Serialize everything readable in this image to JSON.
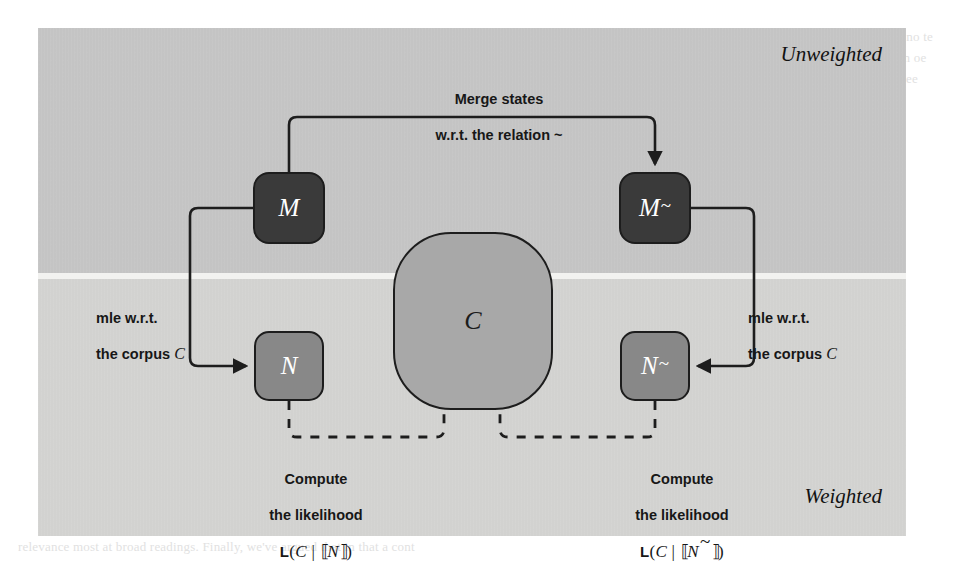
{
  "figure": {
    "regions": [
      {
        "name": "unweighted",
        "label": "Unweighted"
      },
      {
        "name": "weighted",
        "label": "Weighted"
      }
    ],
    "nodes": [
      {
        "id": "M",
        "label": "M",
        "tilde": false,
        "fill": "#3a3a3a",
        "text_color": "#ffffff",
        "shape": "rounded-square"
      },
      {
        "id": "Mt",
        "label": "M",
        "tilde": true,
        "fill": "#3a3a3a",
        "text_color": "#ffffff",
        "shape": "rounded-square"
      },
      {
        "id": "N",
        "label": "N",
        "tilde": false,
        "fill": "#888888",
        "text_color": "#ffffff",
        "shape": "rounded-square"
      },
      {
        "id": "Nt",
        "label": "N",
        "tilde": true,
        "fill": "#888888",
        "text_color": "#ffffff",
        "shape": "rounded-square"
      },
      {
        "id": "C",
        "label": "C",
        "tilde": false,
        "fill": "#a8a8a8",
        "text_color": "#1c1c1c",
        "shape": "squircle"
      }
    ],
    "labels": {
      "merge_line1": "Merge states",
      "merge_line2": "w.r.t. the relation ~",
      "mle_left_line1": "mle w.r.t.",
      "mle_left_line2_prefix": "the corpus ",
      "mle_left_line2_var": "C",
      "mle_right_line1": "mle w.r.t.",
      "mle_right_line2_prefix": "the corpus ",
      "mle_right_line2_var": "C",
      "likelihood_left_line1": "Compute",
      "likelihood_left_line2": "the likelihood",
      "likelihood_left_formula": {
        "fn": "L",
        "open": "(",
        "corpus": "C",
        "bar": " | ",
        "lbracket": "⟦",
        "model": "N",
        "tilde": false,
        "rbracket": "⟧",
        "close": ")"
      },
      "likelihood_right_line1": "Compute",
      "likelihood_right_line2": "the likelihood",
      "likelihood_right_formula": {
        "fn": "L",
        "open": "(",
        "corpus": "C",
        "bar": " | ",
        "lbracket": "⟦",
        "model": "N",
        "tilde": true,
        "rbracket": "⟧",
        "close": ")"
      }
    },
    "colors": {
      "band_top": "#c8c8c8",
      "band_bottom": "#d6d6d4",
      "band_gap": "#f2f2f0",
      "stroke": "#1d1d1d",
      "node_dark": "#3a3a3a",
      "node_mid": "#888888",
      "node_light": "#a8a8a8"
    },
    "edges": [
      {
        "from": "M",
        "to": "Mt",
        "style": "solid",
        "arrow": "end",
        "name": "merge-edge"
      },
      {
        "from": "M",
        "to": "N",
        "style": "solid",
        "arrow": "end",
        "name": "mle-left-edge"
      },
      {
        "from": "Mt",
        "to": "Nt",
        "style": "solid",
        "arrow": "end",
        "name": "mle-right-edge"
      },
      {
        "from": "N",
        "to": "C",
        "style": "dashed",
        "arrow": "none",
        "name": "likelihood-left-edge"
      },
      {
        "from": "Nt",
        "to": "C",
        "style": "dashed",
        "arrow": "none",
        "name": "likelihood-right-edge"
      }
    ]
  },
  "page_bleed": {
    "right_column": "M( we exp oeo\nsoet s no te epar\nthe eost oe lg\nm n oe ee rewr\nA.t coe un co ee",
    "bottom_line": "relevance most at broad readings. Finally, we've argued that in that a cont"
  }
}
